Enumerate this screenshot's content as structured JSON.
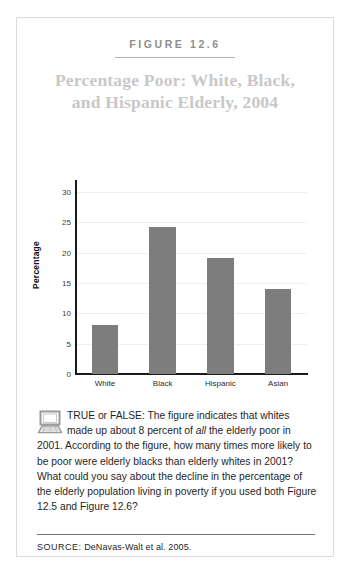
{
  "figure": {
    "label": "FIGURE 12.6",
    "title": "Percentage Poor: White, Black, and Hispanic Elderly, 2004"
  },
  "question": {
    "icon": "computer-icon",
    "text_part1": "TRUE or FALSE: The figure indicates that whites made up about 8 percent of ",
    "emphasis": "all",
    "text_part2": " the elderly poor in 2001. According to the figure, how many times more likely to be poor were elderly blacks than elderly whites in 2001? What could you say about the decline in the percentage of the elderly population living in poverty if you used both Figure 12.5 and Figure 12.6?"
  },
  "source": {
    "label": "SOURCE:",
    "citation": "DeNavas-Walt et al. 2005."
  },
  "colors": {
    "bar": "#7d7d7d",
    "title": "#c8c8c8",
    "figure_label": "#8e8e8e",
    "axis": "#1a1a1a",
    "gridline": "#efefef",
    "border": "#dcdcdc"
  },
  "chart_data": {
    "type": "bar",
    "title": "Percentage Poor: White, Black, and Hispanic Elderly, 2004",
    "categories": [
      "White",
      "Black",
      "Hispanic",
      "Asian"
    ],
    "values": [
      8,
      24.2,
      19.2,
      14
    ],
    "xlabel": "",
    "ylabel": "Percentage",
    "ylim": [
      0,
      31
    ],
    "yticks": [
      0,
      5,
      10,
      15,
      20,
      25,
      30
    ],
    "ytick_labels": [
      "0",
      "5",
      "10",
      "15",
      "20",
      "25",
      "30"
    ],
    "grid": true,
    "legend": false,
    "bar_color": "#7d7d7d"
  }
}
